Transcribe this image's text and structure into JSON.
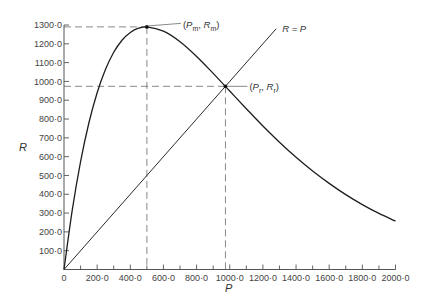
{
  "chart_data": {
    "type": "line",
    "title": "",
    "xlabel": "P",
    "ylabel": "R",
    "xlim": [
      0,
      2000
    ],
    "ylim": [
      0,
      1300
    ],
    "grid": false,
    "legend": "none",
    "x_ticks": [
      {
        "value": 0,
        "label": "0"
      },
      {
        "value": 200,
        "label": "200·0"
      },
      {
        "value": 400,
        "label": "400·0"
      },
      {
        "value": 600,
        "label": "600·0"
      },
      {
        "value": 800,
        "label": "800·0"
      },
      {
        "value": 1000,
        "label": "1000·0"
      },
      {
        "value": 1200,
        "label": "1200·0"
      },
      {
        "value": 1400,
        "label": "1400·0"
      },
      {
        "value": 1600,
        "label": "1600·0"
      },
      {
        "value": 1800,
        "label": "1800·0"
      },
      {
        "value": 2000,
        "label": "2000·0"
      }
    ],
    "x_minor_ticks": [
      100,
      300,
      500,
      700,
      900,
      1100,
      1300,
      1500,
      1700,
      1900
    ],
    "y_ticks": [
      {
        "value": 100,
        "label": "100·0"
      },
      {
        "value": 200,
        "label": "200·0"
      },
      {
        "value": 300,
        "label": "300·0"
      },
      {
        "value": 400,
        "label": "400·0"
      },
      {
        "value": 500,
        "label": "500·0"
      },
      {
        "value": 600,
        "label": "600·0"
      },
      {
        "value": 700,
        "label": "700·0"
      },
      {
        "value": 800,
        "label": "800·0"
      },
      {
        "value": 900,
        "label": "900·0"
      },
      {
        "value": 1000,
        "label": "1000·0"
      },
      {
        "value": 1100,
        "label": "1100·0"
      },
      {
        "value": 1200,
        "label": "1200·0"
      },
      {
        "value": 1300,
        "label": "1300·0"
      }
    ],
    "series": [
      {
        "name": "Recruitment curve",
        "x": [
          0,
          50,
          100,
          150,
          200,
          250,
          300,
          350,
          400,
          450,
          500,
          600,
          700,
          800,
          900,
          1000,
          1100,
          1200,
          1300,
          1400,
          1500,
          1600,
          1700,
          1800,
          1900,
          2000
        ],
        "y": [
          0,
          317,
          574,
          779,
          940,
          1063,
          1155,
          1219,
          1260,
          1283,
          1290,
          1267,
          1211,
          1133,
          1043,
          949,
          855,
          763,
          677,
          597,
          524,
          458,
          398,
          345,
          298,
          257
        ]
      },
      {
        "name": "Replacement line",
        "label": "R = P",
        "x": [
          0,
          1280
        ],
        "y": [
          0,
          1280
        ]
      }
    ],
    "annotations": [
      {
        "name": "maximum-recruitment",
        "x": 500,
        "y": 1290,
        "label_parts": [
          {
            "t": "("
          },
          {
            "t": "P",
            "italic": true
          },
          {
            "t": "m",
            "sub": true
          },
          {
            "t": ", "
          },
          {
            "t": "R",
            "italic": true
          },
          {
            "t": "m",
            "sub": true
          },
          {
            "t": ")"
          }
        ]
      },
      {
        "name": "replacement-point",
        "x": 974,
        "y": 974,
        "label_parts": [
          {
            "t": "("
          },
          {
            "t": "P",
            "italic": true
          },
          {
            "t": "r",
            "sub": true
          },
          {
            "t": ", "
          },
          {
            "t": "R",
            "italic": true
          },
          {
            "t": "r",
            "sub": true
          },
          {
            "t": ")"
          }
        ]
      }
    ]
  }
}
